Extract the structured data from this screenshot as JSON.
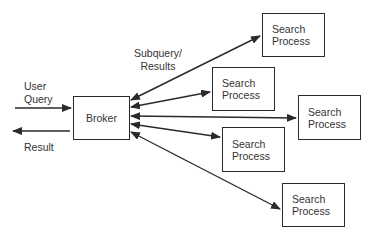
{
  "diagram": {
    "broker": {
      "label": "Broker"
    },
    "search_processes": [
      {
        "label": "Search\nProcess"
      },
      {
        "label": "Search\nProcess"
      },
      {
        "label": "Search\nProcess"
      },
      {
        "label": "Search\nProcess"
      },
      {
        "label": "Search\nProcess"
      }
    ],
    "labels": {
      "user_query": "User\nQuery",
      "result": "Result",
      "subquery_results": "Subquery/\nResults"
    },
    "colors": {
      "stroke": "#2a2a2a",
      "background": "#ffffff"
    }
  }
}
